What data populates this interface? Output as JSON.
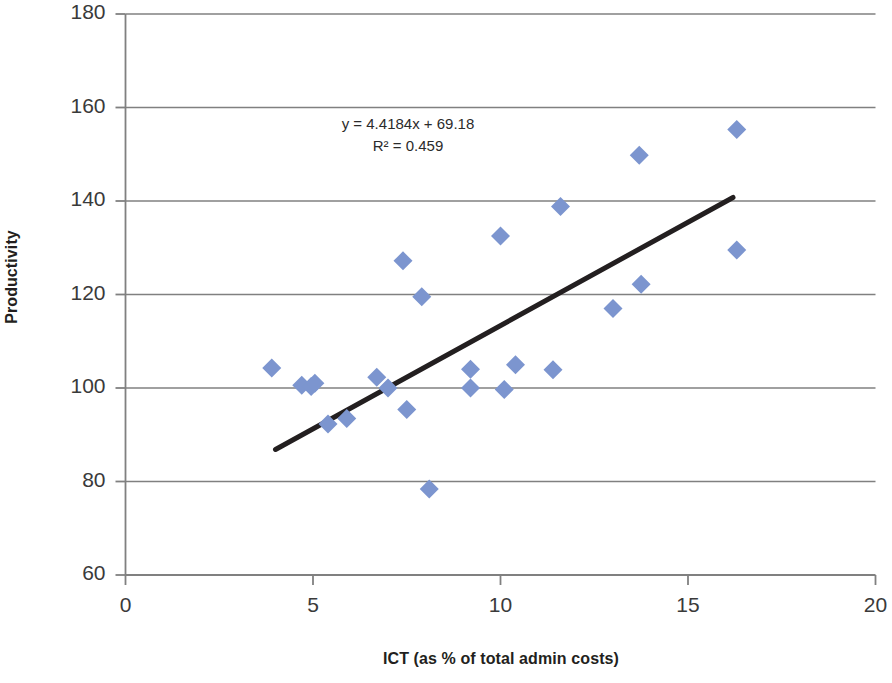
{
  "chart_data": {
    "type": "scatter",
    "title": "",
    "xlabel": "ICT (as % of total admin costs)",
    "ylabel": "Productivity",
    "xlim": [
      0,
      20
    ],
    "ylim": [
      60,
      180
    ],
    "xticks": [
      0,
      5,
      10,
      15,
      20
    ],
    "yticks": [
      60,
      80,
      100,
      120,
      140,
      160,
      180
    ],
    "xtick_labels": [
      "0",
      "5",
      "10",
      "15",
      "20"
    ],
    "ytick_labels": [
      "60",
      "80",
      "100",
      "120",
      "140",
      "160",
      "180"
    ],
    "grid": "horizontal",
    "legend": "none",
    "marker": "diamond",
    "marker_color": "#7C95CF",
    "trendline_color": "#231f20",
    "axis_color": "#808080",
    "points": [
      {
        "x": 3.9,
        "y": 104.3
      },
      {
        "x": 4.7,
        "y": 100.6
      },
      {
        "x": 4.95,
        "y": 100.3
      },
      {
        "x": 5.05,
        "y": 101.0
      },
      {
        "x": 5.4,
        "y": 92.3
      },
      {
        "x": 5.9,
        "y": 93.5
      },
      {
        "x": 6.7,
        "y": 102.3
      },
      {
        "x": 7.0,
        "y": 100.0
      },
      {
        "x": 7.4,
        "y": 127.2
      },
      {
        "x": 7.5,
        "y": 95.4
      },
      {
        "x": 7.9,
        "y": 119.5
      },
      {
        "x": 8.1,
        "y": 78.4
      },
      {
        "x": 9.2,
        "y": 104.0
      },
      {
        "x": 9.2,
        "y": 100.0
      },
      {
        "x": 10.0,
        "y": 132.5
      },
      {
        "x": 10.1,
        "y": 99.7
      },
      {
        "x": 10.4,
        "y": 105.0
      },
      {
        "x": 11.4,
        "y": 103.9
      },
      {
        "x": 11.6,
        "y": 138.8
      },
      {
        "x": 13.0,
        "y": 117.0
      },
      {
        "x": 13.7,
        "y": 149.8
      },
      {
        "x": 13.75,
        "y": 122.2
      },
      {
        "x": 16.3,
        "y": 155.3
      },
      {
        "x": 16.3,
        "y": 129.5
      }
    ],
    "trendline": {
      "slope": 4.4184,
      "intercept": 69.18,
      "r_squared": 0.459,
      "x_start": 4.0,
      "x_end": 16.2,
      "y_start": 86.85,
      "y_end": 140.76
    },
    "annotations": {
      "equation": "y = 4.4184x + 69.18",
      "r_squared_label": "R² = 0.459"
    }
  }
}
